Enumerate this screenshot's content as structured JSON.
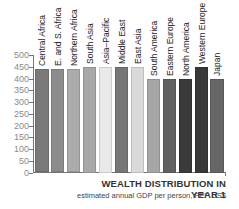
{
  "chart_data": {
    "type": "bar",
    "title": "WEALTH DISTRIBUTION IN YEAR 1",
    "subtitle": "estimated annual GDP per person, PPP US$",
    "xlabel": "",
    "ylabel": "",
    "ylim": [
      0,
      500
    ],
    "yticks": [
      0,
      50,
      100,
      150,
      200,
      250,
      300,
      350,
      400,
      450,
      500
    ],
    "grid": false,
    "legend": "none",
    "categories": [
      "Central Africa",
      "E. and S. Africa",
      "Northern Africa",
      "South Asia",
      "Asia–Pacific",
      "Middle East",
      "East Asia",
      "South America",
      "Eastern Europe",
      "North America",
      "Western Europe",
      "Japan"
    ],
    "values": [
      440,
      440,
      440,
      450,
      450,
      450,
      450,
      400,
      400,
      400,
      450,
      400
    ],
    "colors": [
      "#7a7a7a",
      "#8c8c8c",
      "#ababab",
      "#a8a8a8",
      "#e9e9e9",
      "#777777",
      "#d9d9d9",
      "#a6a6a6",
      "#616161",
      "#3a3a3a",
      "#383838",
      "#666666"
    ]
  }
}
